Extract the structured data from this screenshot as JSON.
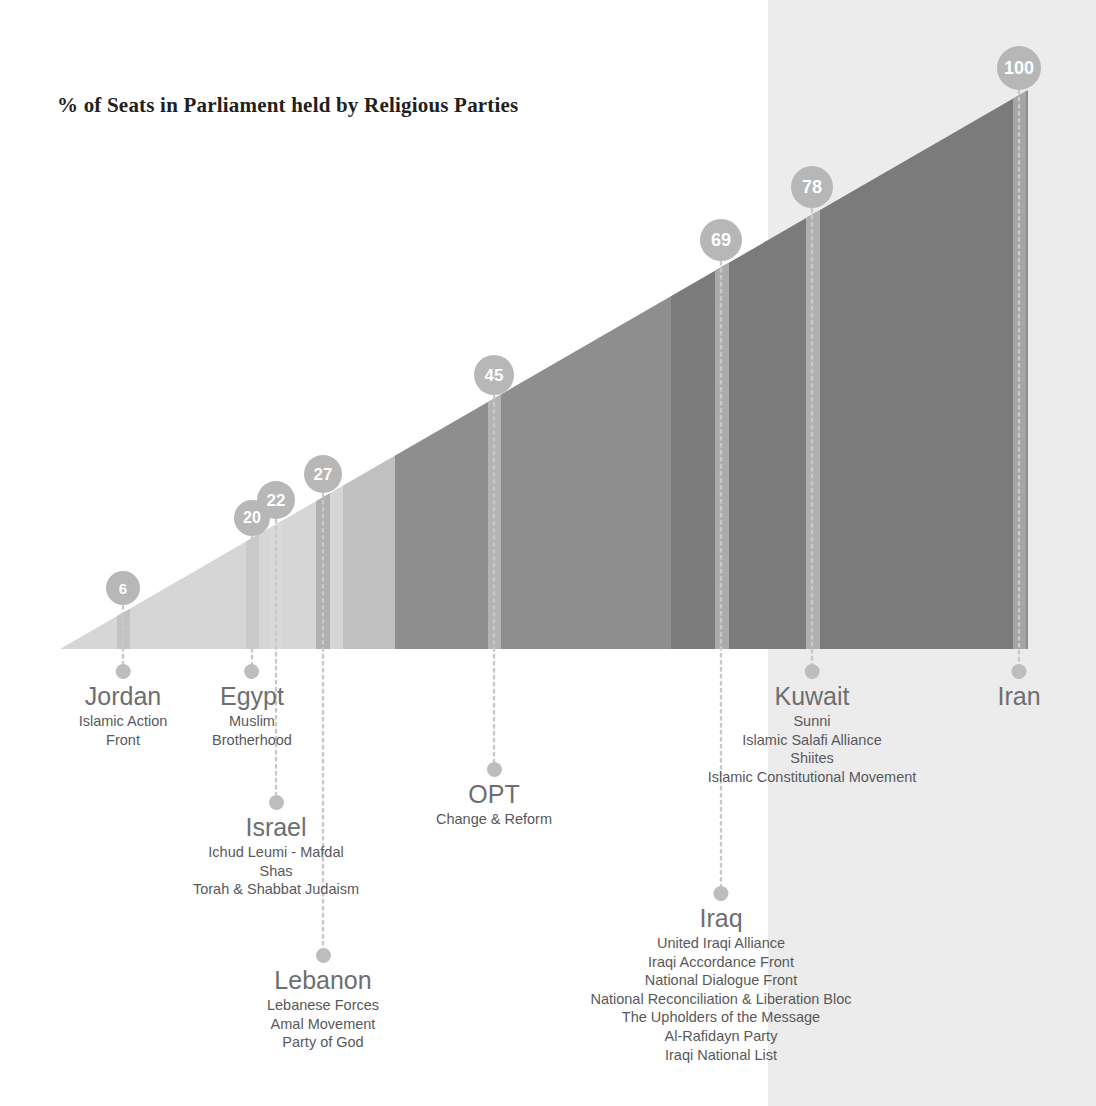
{
  "chart_title": "% of Seats in Parliament held by Religious Parties",
  "colors": {
    "wedge_light": "#d6d6d6",
    "wedge_mid": "#a8a8a8",
    "wedge_dark": "#7b7b7b",
    "wedge_darkest": "#6e6e6e",
    "bar_highlight": "#c8c8c8",
    "badge_fill": "#b7b7b7",
    "badge_text": "#ffffff",
    "background_band": "#ececec",
    "label_country": "#6d6e71",
    "label_party": "#58595b",
    "title": "#231f20",
    "dot": "#bdbdbd",
    "connector": "#c9c9c9"
  },
  "chart_data": {
    "type": "bar",
    "title": "% of Seats in Parliament held by Religious Parties",
    "xlabel": "",
    "ylabel": "% of Seats in Parliament held by Religious Parties",
    "ylim": [
      0,
      100
    ],
    "grid": false,
    "legend": "none",
    "categories": [
      "Jordan",
      "Egypt",
      "Israel",
      "Lebanon",
      "OPT",
      "Iraq",
      "Kuwait",
      "Iran"
    ],
    "values": [
      6,
      20,
      22,
      27,
      45,
      69,
      78,
      100
    ],
    "units": "percent",
    "annotations": [
      "Values shown in circular badges above each country bar",
      "Wedge rises linearly left-to-right from 0% to 100%"
    ]
  },
  "countries": [
    {
      "name": "Jordan",
      "value": 6,
      "value_text": "6",
      "x": 123,
      "badge": {
        "x": 123,
        "y": 588,
        "size": 34,
        "font_size": 15
      },
      "label": {
        "x": 123,
        "y": 664,
        "dot": true
      },
      "parties": [
        "Islamic Action",
        "Front"
      ]
    },
    {
      "name": "Egypt",
      "value": 20,
      "value_text": "20",
      "x": 252,
      "badge": {
        "x": 252,
        "y": 518,
        "size": 36,
        "font_size": 16
      },
      "label": {
        "x": 252,
        "y": 664,
        "dot": true
      },
      "parties": [
        "Muslim",
        "Brotherhood"
      ]
    },
    {
      "name": "Israel",
      "value": 22,
      "value_text": "22",
      "x": 276,
      "badge": {
        "x": 276,
        "y": 500,
        "size": 38,
        "font_size": 17
      },
      "label": {
        "x": 276,
        "y": 795,
        "dot": true
      },
      "parties": [
        "Ichud Leumi - Mafdal",
        "Shas",
        "Torah & Shabbat Judaism"
      ]
    },
    {
      "name": "Lebanon",
      "value": 27,
      "value_text": "27",
      "x": 323,
      "badge": {
        "x": 323,
        "y": 474,
        "size": 38,
        "font_size": 17
      },
      "label": {
        "x": 323,
        "y": 948,
        "dot": true
      },
      "parties": [
        "Lebanese Forces",
        "Amal Movement",
        "Party of God"
      ]
    },
    {
      "name": "OPT",
      "value": 45,
      "value_text": "45",
      "x": 494,
      "badge": {
        "x": 494,
        "y": 375,
        "size": 40,
        "font_size": 17
      },
      "label": {
        "x": 494,
        "y": 762,
        "dot": true
      },
      "parties": [
        "Change & Reform"
      ]
    },
    {
      "name": "Iraq",
      "value": 69,
      "value_text": "69",
      "x": 721,
      "badge": {
        "x": 721,
        "y": 240,
        "size": 42,
        "font_size": 18
      },
      "label": {
        "x": 721,
        "y": 886,
        "dot": true
      },
      "parties": [
        "United Iraqi Alliance",
        "Iraqi Accordance Front",
        "National Dialogue Front",
        "National Reconciliation & Liberation Bloc",
        "The Upholders of the Message",
        "Al-Rafidayn Party",
        "Iraqi National List"
      ]
    },
    {
      "name": "Kuwait",
      "value": 78,
      "value_text": "78",
      "x": 812,
      "badge": {
        "x": 812,
        "y": 187,
        "size": 42,
        "font_size": 18
      },
      "label": {
        "x": 812,
        "y": 664,
        "dot": true
      },
      "parties": [
        "Sunni",
        "Islamic Salafi Alliance",
        "Shiites",
        "Islamic Constitutional Movement"
      ]
    },
    {
      "name": "Iran",
      "value": 100,
      "value_text": "100",
      "x": 1019,
      "badge": {
        "x": 1019,
        "y": 68,
        "size": 44,
        "font_size": 18
      },
      "label": {
        "x": 1019,
        "y": 664,
        "dot": true
      },
      "parties": []
    }
  ]
}
